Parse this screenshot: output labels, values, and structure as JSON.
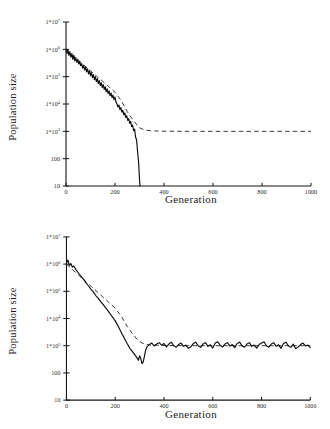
{
  "chart_data": [
    {
      "id": "top-panel",
      "type": "line",
      "title": "",
      "subtitle": "",
      "xlabel": "Generation",
      "ylabel": "Population size",
      "yscale": "log",
      "xscale": "linear",
      "xlim": [
        0,
        1000
      ],
      "ylim": [
        10,
        10000000
      ],
      "grid": false,
      "legend": false,
      "legend_position": "none",
      "annotations": [],
      "xticks": [
        0,
        200,
        400,
        600,
        800,
        1000
      ],
      "xticklabels": [
        "0",
        "200",
        "400",
        "600",
        "800",
        "1000"
      ],
      "yticks": [
        10,
        100,
        1000,
        10000,
        100000,
        1000000,
        10000000
      ],
      "yticklabels": [
        "10",
        "100",
        "1*10^3",
        "1*10^4",
        "1*10^5",
        "1*10^6",
        "1*10^7"
      ],
      "yticklabels_parts": [
        {
          "base": "10",
          "exp": ""
        },
        {
          "base": "100",
          "exp": ""
        },
        {
          "base": "1*10",
          "exp": "3"
        },
        {
          "base": "1*10",
          "exp": "4"
        },
        {
          "base": "1*10",
          "exp": "5"
        },
        {
          "base": "1*10",
          "exp": "6"
        },
        {
          "base": "1*10",
          "exp": "7"
        }
      ],
      "series": [
        {
          "name": "stochastic simulation",
          "style": "solid",
          "color": "#0d0d0d",
          "x": [
            0,
            4,
            8,
            12,
            16,
            20,
            24,
            28,
            32,
            36,
            40,
            44,
            48,
            52,
            56,
            60,
            64,
            68,
            72,
            76,
            80,
            84,
            88,
            92,
            96,
            100,
            104,
            108,
            112,
            116,
            120,
            124,
            128,
            132,
            136,
            140,
            144,
            148,
            152,
            156,
            160,
            164,
            168,
            172,
            176,
            180,
            184,
            188,
            192,
            196,
            200,
            204,
            208,
            212,
            216,
            220,
            224,
            228,
            232,
            236,
            240,
            244,
            248,
            252,
            256,
            260,
            264,
            268,
            272,
            276,
            280,
            284,
            288,
            292,
            296,
            300,
            302
          ],
          "y": [
            1000000,
            700000,
            950000,
            600000,
            820000,
            520000,
            700000,
            430000,
            600000,
            380000,
            500000,
            330000,
            430000,
            290000,
            360000,
            250000,
            300000,
            205000,
            260000,
            175000,
            225000,
            150000,
            195000,
            125000,
            165000,
            108000,
            140000,
            92000,
            118000,
            78000,
            100000,
            66000,
            85000,
            56000,
            72000,
            47000,
            60000,
            40000,
            51000,
            34000,
            43000,
            28000,
            36000,
            24000,
            30000,
            20000,
            25000,
            17000,
            21000,
            14500,
            18000,
            12000,
            10000,
            7800,
            9200,
            6200,
            7400,
            5000,
            5900,
            4000,
            4700,
            3200,
            3700,
            2500,
            2900,
            1950,
            2300,
            1500,
            1700,
            1050,
            1200,
            620,
            480,
            190,
            80,
            18,
            10
          ],
          "description": "noisy declining population crashing to extinction near generation 300"
        },
        {
          "name": "deterministic expectation",
          "style": "dashed",
          "color": "#3a3a3a",
          "x": [
            0,
            25,
            50,
            75,
            100,
            125,
            150,
            175,
            200,
            225,
            250,
            260,
            270,
            280,
            290,
            300,
            320,
            350,
            400,
            450,
            500,
            550,
            600,
            650,
            700,
            750,
            800,
            850,
            900,
            950,
            1000
          ],
          "y": [
            950000,
            620000,
            400000,
            255000,
            165000,
            105000,
            67000,
            43000,
            27000,
            13500,
            5200,
            3900,
            2900,
            2200,
            1700,
            1350,
            1120,
            1040,
            1010,
            1005,
            1002,
            1001,
            1000,
            1000,
            1000,
            1000,
            1000,
            1000,
            1000,
            1000,
            1000
          ],
          "description": "smooth decline levelling off on a plateau at 1*10^3"
        }
      ]
    },
    {
      "id": "bottom-panel",
      "type": "line",
      "title": "",
      "subtitle": "",
      "xlabel": "Generation",
      "ylabel": "Population size",
      "yscale": "log",
      "xscale": "linear",
      "xlim": [
        0,
        1000
      ],
      "ylim": [
        10,
        10000000
      ],
      "grid": false,
      "legend": false,
      "legend_position": "none",
      "annotations": [],
      "xticks": [
        0,
        200,
        400,
        600,
        800,
        1000
      ],
      "xticklabels": [
        "0",
        "200",
        "400",
        "600",
        "800",
        "1000"
      ],
      "yticks": [
        10,
        100,
        1000,
        10000,
        100000,
        1000000,
        10000000
      ],
      "yticklabels": [
        "10",
        "100",
        "1*10^3",
        "1*10^4",
        "1*10^5",
        "1*10^6",
        "1*10^7"
      ],
      "yticklabels_parts": [
        {
          "base": "10",
          "exp": ""
        },
        {
          "base": "100",
          "exp": ""
        },
        {
          "base": "1*10",
          "exp": "3"
        },
        {
          "base": "1*10",
          "exp": "4"
        },
        {
          "base": "1*10",
          "exp": "5"
        },
        {
          "base": "1*10",
          "exp": "6"
        },
        {
          "base": "1*10",
          "exp": "7"
        }
      ],
      "series": [
        {
          "name": "stochastic simulation",
          "style": "solid",
          "color": "#0d0d0d",
          "x": [
            0,
            6,
            12,
            18,
            24,
            30,
            40,
            50,
            60,
            70,
            80,
            90,
            100,
            110,
            120,
            130,
            140,
            150,
            160,
            170,
            180,
            190,
            200,
            210,
            220,
            230,
            240,
            250,
            260,
            270,
            280,
            290,
            295,
            300,
            305,
            310,
            315,
            320,
            325,
            330,
            340,
            350,
            360,
            370,
            380,
            390,
            400,
            410,
            420,
            430,
            440,
            450,
            460,
            470,
            480,
            490,
            500,
            510,
            520,
            530,
            540,
            550,
            560,
            570,
            580,
            590,
            600,
            610,
            620,
            630,
            640,
            650,
            660,
            670,
            680,
            690,
            700,
            710,
            720,
            730,
            740,
            750,
            760,
            770,
            780,
            790,
            800,
            810,
            820,
            830,
            840,
            850,
            860,
            870,
            880,
            890,
            900,
            910,
            920,
            930,
            940,
            950,
            960,
            970,
            980,
            990,
            1000
          ],
          "y": [
            1100000,
            1400000,
            900000,
            1050000,
            780000,
            850000,
            600000,
            460000,
            350000,
            280000,
            205000,
            160000,
            120000,
            95000,
            70000,
            56000,
            42000,
            33000,
            25000,
            19500,
            14500,
            11000,
            8200,
            5600,
            3800,
            2500,
            1700,
            1150,
            800,
            620,
            470,
            350,
            290,
            430,
            330,
            220,
            260,
            420,
            700,
            900,
            1100,
            1250,
            980,
            1150,
            1300,
            1050,
            1200,
            900,
            1150,
            1350,
            1000,
            880,
            1100,
            1250,
            950,
            1050,
            800,
            900,
            1200,
            1350,
            1000,
            870,
            1150,
            1300,
            950,
            1080,
            820,
            1250,
            1400,
            1050,
            900,
            1150,
            1300,
            980,
            1100,
            850,
            1200,
            1350,
            1000,
            880,
            1150,
            1300,
            950,
            1050,
            820,
            1100,
            1250,
            1400,
            1000,
            880,
            1150,
            1300,
            950,
            1080,
            800,
            1200,
            1350,
            1000,
            870,
            1150,
            780,
            900,
            1100,
            1250,
            980,
            1050,
            850,
            1100,
            950
          ],
          "description": "noisy decline, transient dip to roughly 200 near generation 310, then fluctuating plateau around 1*10^3"
        },
        {
          "name": "deterministic expectation",
          "style": "dashed",
          "color": "#3a3a3a",
          "x": [
            0,
            25,
            50,
            75,
            100,
            125,
            150,
            175,
            200,
            225,
            250,
            270,
            290,
            310,
            330,
            350,
            400,
            450,
            500,
            550,
            600,
            650,
            700,
            750,
            800,
            850,
            900,
            950,
            1000
          ],
          "y": [
            1000000,
            620000,
            390000,
            245000,
            155000,
            98000,
            61000,
            38000,
            24000,
            12000,
            5000,
            2800,
            1700,
            1250,
            1100,
            1050,
            1020,
            1010,
            1005,
            1000,
            1000,
            1000,
            1000,
            1000,
            1000,
            1000,
            1000,
            1000,
            1000
          ],
          "description": "smooth decline reaching a plateau at 1*10^3"
        }
      ]
    }
  ],
  "panels": [
    {
      "xlabel": "Generation",
      "ylabel": "Population size"
    },
    {
      "xlabel": "Generation",
      "ylabel": "Population size"
    }
  ]
}
